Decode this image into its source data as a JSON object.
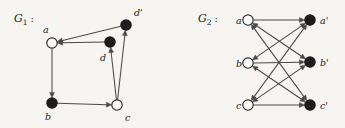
{
  "figure": {
    "background_color": "#f7f5f2",
    "width": 345,
    "height": 128,
    "node_fill_open": "#fbfaf8",
    "node_fill_closed": "#1c1c1c",
    "edge_color": "#4a4a4a"
  },
  "graphs": [
    {
      "id": "G1",
      "title_main": "G",
      "title_sub": "1",
      "title_colon": ":",
      "nodes": [
        {
          "name": "a",
          "label": "a",
          "x": 52,
          "y": 43,
          "r": 5.2,
          "style": "open",
          "label_x": 43,
          "label_y": 33
        },
        {
          "name": "b",
          "label": "b",
          "x": 52,
          "y": 103,
          "r": 5.2,
          "style": "filled",
          "label_x": 45,
          "label_y": 120
        },
        {
          "name": "c",
          "label": "c",
          "x": 117,
          "y": 105,
          "r": 5.2,
          "style": "open",
          "label_x": 125,
          "label_y": 121
        },
        {
          "name": "d",
          "label": "d",
          "x": 110,
          "y": 42,
          "r": 5.2,
          "style": "filled",
          "label_x": 100,
          "label_y": 61
        },
        {
          "name": "dp",
          "label": "d'",
          "x": 126,
          "y": 25,
          "r": 5.2,
          "style": "filled",
          "label_x": 134,
          "label_y": 16
        }
      ],
      "edges": [
        {
          "from": "a",
          "to": "b",
          "arrow": "end"
        },
        {
          "from": "b",
          "to": "c",
          "arrow": "end"
        },
        {
          "from": "c",
          "to": "dp",
          "arrow": "end"
        },
        {
          "from": "dp",
          "to": "a",
          "arrow": "end"
        },
        {
          "from": "d",
          "to": "a",
          "arrow": "end"
        },
        {
          "from": "c",
          "to": "d",
          "arrow": "end"
        }
      ]
    },
    {
      "id": "G2",
      "title_main": "G",
      "title_sub": "2",
      "title_colon": ":",
      "nodes": [
        {
          "name": "a",
          "label": "a",
          "x": 248,
          "y": 20,
          "r": 5.2,
          "style": "open",
          "label_x": 236,
          "label_y": 24
        },
        {
          "name": "b",
          "label": "b",
          "x": 248,
          "y": 63,
          "r": 5.2,
          "style": "open",
          "label_x": 236,
          "label_y": 67
        },
        {
          "name": "c",
          "label": "c",
          "x": 248,
          "y": 105,
          "r": 5.2,
          "style": "open",
          "label_x": 236,
          "label_y": 109
        },
        {
          "name": "ap",
          "label": "a'",
          "x": 310,
          "y": 20,
          "r": 5.2,
          "style": "filled",
          "label_x": 320,
          "label_y": 24
        },
        {
          "name": "bp",
          "label": "b'",
          "x": 310,
          "y": 62,
          "r": 5.2,
          "style": "filled",
          "label_x": 320,
          "label_y": 66
        },
        {
          "name": "cp",
          "label": "c'",
          "x": 310,
          "y": 105,
          "r": 5.2,
          "style": "filled",
          "label_x": 320,
          "label_y": 109
        }
      ],
      "edges": [
        {
          "from": "a",
          "to": "ap",
          "arrow": "end"
        },
        {
          "from": "a",
          "to": "bp",
          "arrow": "both"
        },
        {
          "from": "a",
          "to": "cp",
          "arrow": "both"
        },
        {
          "from": "b",
          "to": "ap",
          "arrow": "both"
        },
        {
          "from": "b",
          "to": "bp",
          "arrow": "end"
        },
        {
          "from": "b",
          "to": "cp",
          "arrow": "both"
        },
        {
          "from": "c",
          "to": "ap",
          "arrow": "both"
        },
        {
          "from": "c",
          "to": "bp",
          "arrow": "both"
        },
        {
          "from": "c",
          "to": "cp",
          "arrow": "end"
        }
      ]
    }
  ]
}
